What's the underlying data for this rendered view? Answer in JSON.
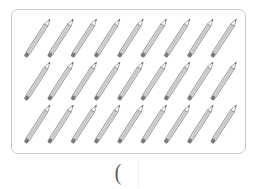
{
  "figure": {
    "object": "pencil",
    "rows": 3,
    "per_row": 9,
    "total_count": 27,
    "colors": {
      "frame_border": "#c8c8c8",
      "pencil_body": "#d9d9d9",
      "pencil_stroke": "#8a8a8a",
      "eraser": "#7a7a7a"
    }
  },
  "answer": {
    "open_paren": "("
  }
}
